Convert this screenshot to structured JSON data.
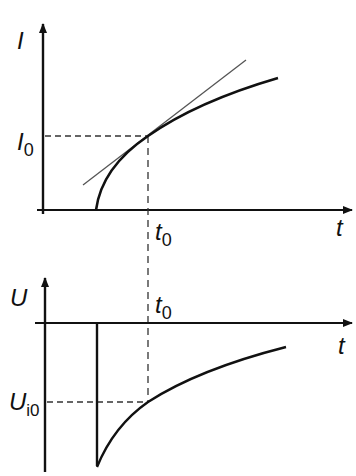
{
  "diagram": {
    "top_plot": {
      "y_axis_label": "I",
      "x_axis_label": "t",
      "marker_y_label": "I",
      "marker_y_subscript": "0",
      "marker_x_label": "t",
      "marker_x_subscript": "0",
      "curve": "current-rising-curve",
      "tangent": "tangent-line-at-t0"
    },
    "bottom_plot": {
      "y_axis_label": "U",
      "x_axis_label": "t",
      "marker_y_label": "U",
      "marker_y_subscript": "i0",
      "marker_x_label": "t",
      "marker_x_subscript": "0",
      "curve": "voltage-recovery-curve"
    },
    "colors": {
      "line": "#111111",
      "thin_line": "#555555",
      "background": "#ffffff"
    }
  }
}
